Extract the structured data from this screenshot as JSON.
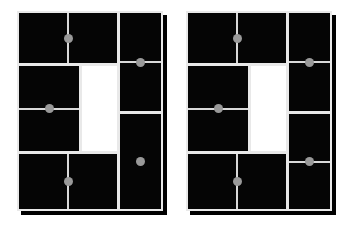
{
  "scene": {
    "title": "Two black grid panels with gray dot markers",
    "background_color": "#ffffff",
    "panel_fill_color": "#050505",
    "panel_gap_color": "#e9e9e9",
    "shadow_color": "#000000",
    "dot_color": "#999999",
    "line_color": "#d9d9d9",
    "white_cell_color": "#ffffff"
  },
  "panels": [
    {
      "id": "left-panel",
      "label": "Left panel",
      "x": 17,
      "y": 11,
      "width": 146,
      "height": 200,
      "cells": [
        {
          "id": "top-left",
          "label": "Top left cell",
          "x": 2,
          "y": 2,
          "w": 98,
          "h": 50,
          "fill": "black",
          "mark": "vertical-line",
          "dot": true
        },
        {
          "id": "mid-left",
          "label": "Middle left cell",
          "x": 2,
          "y": 55,
          "w": 60,
          "h": 85,
          "fill": "black",
          "mark": "horizontal-line",
          "dot": true
        },
        {
          "id": "center-white",
          "label": "Center white cell",
          "x": 65,
          "y": 55,
          "w": 35,
          "h": 85,
          "fill": "white",
          "mark": "none",
          "dot": false
        },
        {
          "id": "bottom-left",
          "label": "Bottom left cell",
          "x": 2,
          "y": 143,
          "w": 98,
          "h": 55,
          "fill": "black",
          "mark": "vertical-line",
          "dot": true
        },
        {
          "id": "top-right",
          "label": "Top right cell",
          "x": 103,
          "y": 2,
          "w": 41,
          "h": 98,
          "fill": "black",
          "mark": "horizontal-line",
          "dot": true
        },
        {
          "id": "bottom-right",
          "label": "Bottom right cell",
          "x": 103,
          "y": 103,
          "w": 41,
          "h": 95,
          "fill": "black",
          "mark": "none",
          "dot": true
        }
      ]
    },
    {
      "id": "right-panel",
      "label": "Right panel",
      "x": 186,
      "y": 11,
      "width": 146,
      "height": 200,
      "cells": [
        {
          "id": "top-left",
          "label": "Top left cell",
          "x": 2,
          "y": 2,
          "w": 98,
          "h": 50,
          "fill": "black",
          "mark": "vertical-line",
          "dot": true
        },
        {
          "id": "mid-left",
          "label": "Middle left cell",
          "x": 2,
          "y": 55,
          "w": 60,
          "h": 85,
          "fill": "black",
          "mark": "horizontal-line",
          "dot": true
        },
        {
          "id": "center-white",
          "label": "Center white cell",
          "x": 65,
          "y": 55,
          "w": 35,
          "h": 85,
          "fill": "white",
          "mark": "none",
          "dot": false
        },
        {
          "id": "bottom-left",
          "label": "Bottom left cell",
          "x": 2,
          "y": 143,
          "w": 98,
          "h": 55,
          "fill": "black",
          "mark": "vertical-line",
          "dot": true
        },
        {
          "id": "top-right",
          "label": "Top right cell",
          "x": 103,
          "y": 2,
          "w": 41,
          "h": 98,
          "fill": "black",
          "mark": "horizontal-line",
          "dot": true
        },
        {
          "id": "bottom-right",
          "label": "Bottom right cell",
          "x": 103,
          "y": 103,
          "w": 41,
          "h": 95,
          "fill": "black",
          "mark": "horizontal-line",
          "dot": true
        }
      ]
    }
  ]
}
